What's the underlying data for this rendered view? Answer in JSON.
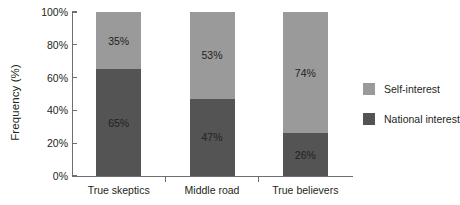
{
  "chart_data": {
    "type": "bar",
    "stacked": true,
    "stack_mode": "percent",
    "title": "",
    "xlabel": "",
    "ylabel": "Frequency (%)",
    "categories": [
      "True skeptics",
      "Middle road",
      "True believers"
    ],
    "ylim": [
      0,
      100
    ],
    "yticks": [
      0,
      20,
      40,
      60,
      80,
      100
    ],
    "ytick_labels": [
      "0%",
      "20%",
      "40%",
      "60%",
      "80%",
      "100%"
    ],
    "grid": false,
    "legend_position": "right",
    "series": [
      {
        "name": "Self-interest",
        "color": "#9a9a9a",
        "values": [
          35,
          53,
          74
        ],
        "value_labels": [
          "35%",
          "53%",
          "74%"
        ]
      },
      {
        "name": "National interest",
        "color": "#545454",
        "values": [
          65,
          47,
          26
        ],
        "value_labels": [
          "65%",
          "47%",
          "26%"
        ]
      }
    ]
  },
  "axis": {
    "y_title": "Frequency (%)",
    "tick_color": "#6d6e71"
  },
  "legend": {
    "items": [
      {
        "label": "Self-interest",
        "color": "#9a9a9a"
      },
      {
        "label": "National interest",
        "color": "#545454"
      }
    ]
  }
}
